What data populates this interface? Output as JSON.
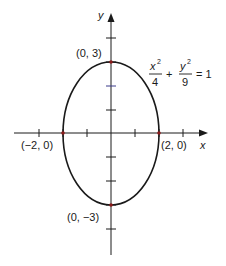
{
  "diagram": {
    "axes": {
      "x_label": "x",
      "y_label": "y"
    },
    "equation": {
      "term1_num": "x",
      "term1_exp": "2",
      "term1_den": "4",
      "plus": "+",
      "term2_num": "y",
      "term2_exp": "2",
      "term2_den": "9",
      "equals": "= 1"
    },
    "points": [
      {
        "label": "(0, 3)",
        "x": 0,
        "y": 3
      },
      {
        "label": "(0, −3)",
        "x": 0,
        "y": -3
      },
      {
        "label": "(−2, 0)",
        "x": -2,
        "y": 0
      },
      {
        "label": "(2, 0)",
        "x": 2,
        "y": 0
      }
    ],
    "ellipse": {
      "a": 2,
      "b": 3,
      "center": [
        0,
        0
      ]
    },
    "ticks": {
      "x": [
        -3,
        -2,
        -1,
        1,
        2,
        3
      ],
      "y": [
        -4,
        -3,
        -2,
        -1,
        1,
        2,
        3,
        4
      ]
    },
    "colors": {
      "curve": "#1a1a1a",
      "axis": "#1a1a1a",
      "point": "#8b1a1a",
      "tick_highlight": "#3a3a8a"
    }
  }
}
